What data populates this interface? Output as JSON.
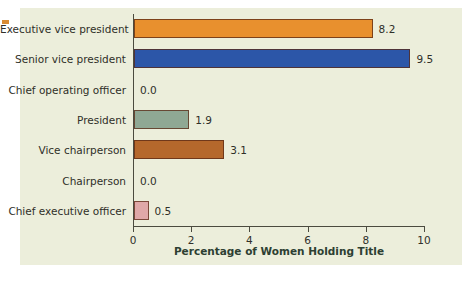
{
  "chart_data": {
    "type": "bar",
    "orientation": "horizontal",
    "title": "",
    "xlabel": "Percentage of Women Holding Title",
    "ylabel": "",
    "xlim": [
      0,
      10.6
    ],
    "xticks": [
      0,
      2,
      4,
      6,
      8,
      10
    ],
    "xtick_labels": [
      "0",
      "2",
      "4",
      "6",
      "8",
      "10"
    ],
    "grid": false,
    "legend": "none",
    "categories": [
      "Executive vice president",
      "Senior vice president",
      "Chief operating officer",
      "President",
      "Vice chairperson",
      "Chairperson",
      "Chief executive officer"
    ],
    "values": [
      8.2,
      9.5,
      0.0,
      1.9,
      3.1,
      0.0,
      0.5
    ],
    "value_labels": [
      "8.2",
      "9.5",
      "0.0",
      "1.9",
      "3.1",
      "0.0",
      "0.5"
    ],
    "bar_colors": [
      "#e8902e",
      "#2c56a8",
      "#eceedb",
      "#8fa894",
      "#b5682c",
      "#eceedb",
      "#e0a8a8"
    ]
  },
  "figure": {
    "background": "#eceedb",
    "page_background": "#ffffff",
    "axis_color": "#4b4b3f",
    "label_color": "#2f2f28",
    "xlabel_color": "#2d4032",
    "edge_mark_color": "#d98b33"
  }
}
